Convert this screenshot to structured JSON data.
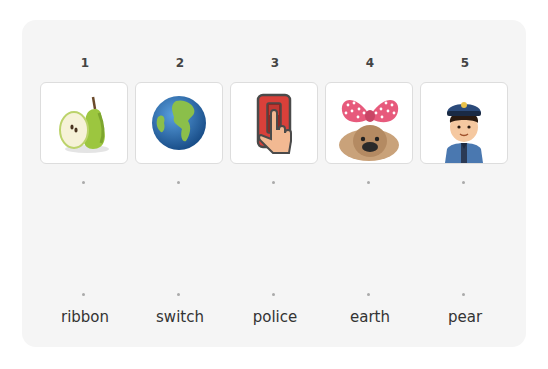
{
  "exercise": {
    "pictures": [
      {
        "number": "1",
        "image": "pear-icon",
        "color": "#8bbf3c"
      },
      {
        "number": "2",
        "image": "earth-globe-icon",
        "color": "#2a6fb3"
      },
      {
        "number": "3",
        "image": "switch-icon",
        "color": "#d9403a"
      },
      {
        "number": "4",
        "image": "dog-with-ribbon-icon",
        "color": "#e75a7c"
      },
      {
        "number": "5",
        "image": "police-officer-icon",
        "color": "#2b4a7a"
      }
    ],
    "words": [
      {
        "label": "ribbon"
      },
      {
        "label": "switch"
      },
      {
        "label": "police"
      },
      {
        "label": "earth"
      },
      {
        "label": "pear"
      }
    ]
  }
}
